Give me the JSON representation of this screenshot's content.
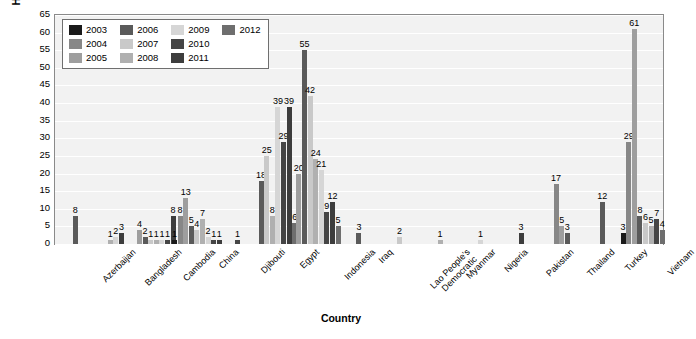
{
  "chart_data": {
    "type": "bar",
    "title": "",
    "xlabel": "Country",
    "ylabel": "Human H5N1 Cases",
    "ylim": [
      0,
      65
    ],
    "ytick_step": 5,
    "yticks": [
      65,
      60,
      55,
      50,
      45,
      40,
      35,
      30,
      25,
      20,
      15,
      10,
      5,
      0
    ],
    "grid": true,
    "legend_position": "top-left-inside",
    "categories": [
      "Azerbaijan",
      "Bangladesh",
      "Cambodia",
      "China",
      "Djibouti",
      "Egypt",
      "Indonesia",
      "Iraq",
      "Lao People's Democratic",
      "Myanmar",
      "Nigeria",
      "Pakistan",
      "Thailand",
      "Turkey",
      "Vietnam"
    ],
    "series": [
      {
        "name": "2003",
        "color": "#1a1a1a",
        "values": [
          0,
          0,
          0,
          1,
          0,
          0,
          0,
          0,
          0,
          0,
          0,
          0,
          0,
          0,
          3
        ]
      },
      {
        "name": "2004",
        "color": "#878787",
        "values": [
          0,
          0,
          0,
          8,
          0,
          0,
          0,
          0,
          0,
          0,
          0,
          0,
          17,
          0,
          29
        ]
      },
      {
        "name": "2005",
        "color": "#9e9e9e",
        "values": [
          0,
          0,
          4,
          13,
          0,
          0,
          20,
          0,
          0,
          0,
          0,
          0,
          5,
          0,
          61
        ]
      },
      {
        "name": "2006",
        "color": "#5a5a5a",
        "values": [
          8,
          0,
          2,
          5,
          0,
          18,
          55,
          3,
          0,
          0,
          0,
          0,
          3,
          12,
          8
        ]
      },
      {
        "name": "2007",
        "color": "#c9c9c9",
        "values": [
          0,
          0,
          1,
          4,
          0,
          25,
          42,
          0,
          2,
          0,
          0,
          0,
          0,
          0,
          6
        ]
      },
      {
        "name": "2008",
        "color": "#b0b0b0",
        "values": [
          0,
          1,
          1,
          7,
          0,
          8,
          24,
          0,
          0,
          1,
          0,
          0,
          0,
          0,
          5
        ]
      },
      {
        "name": "2009",
        "color": "#d6d6d6",
        "values": [
          0,
          2,
          1,
          2,
          0,
          39,
          21,
          0,
          0,
          0,
          1,
          0,
          0,
          0,
          0
        ]
      },
      {
        "name": "2010",
        "color": "#454545",
        "values": [
          0,
          0,
          1,
          1,
          1,
          29,
          9,
          0,
          0,
          0,
          0,
          0,
          0,
          0,
          7
        ]
      },
      {
        "name": "2011",
        "color": "#3d3d3d",
        "values": [
          0,
          3,
          8,
          1,
          0,
          39,
          12,
          0,
          0,
          0,
          0,
          3,
          0,
          0,
          0
        ]
      },
      {
        "name": "2012",
        "color": "#6e6e6e",
        "values": [
          0,
          0,
          0,
          0,
          0,
          6,
          5,
          0,
          0,
          0,
          0,
          0,
          0,
          0,
          4
        ]
      }
    ],
    "bar_labels": {
      "Azerbaijan": [
        8
      ],
      "Bangladesh": [
        1,
        2,
        3
      ],
      "Cambodia": [
        4,
        2,
        1,
        1,
        1,
        1,
        8
      ],
      "China": [
        1,
        8,
        13,
        5,
        4,
        7,
        2,
        1,
        1
      ],
      "Djibouti": [
        1
      ],
      "Egypt": [
        18,
        25,
        8,
        39,
        29,
        39,
        6
      ],
      "Indonesia": [
        20,
        55,
        42,
        24,
        21,
        9,
        12,
        5
      ],
      "Iraq": [
        3
      ],
      "Lao People's Democratic": [
        2
      ],
      "Myanmar": [
        1
      ],
      "Nigeria": [
        1
      ],
      "Pakistan": [
        3
      ],
      "Thailand": [
        17,
        5,
        3
      ],
      "Turkey": [
        12
      ],
      "Vietnam": [
        3,
        29,
        61,
        8,
        6,
        5,
        7,
        4
      ]
    }
  },
  "legend": {
    "items": [
      {
        "label": "2003",
        "color": "#1a1a1a"
      },
      {
        "label": "2006",
        "color": "#5a5a5a"
      },
      {
        "label": "2009",
        "color": "#d6d6d6"
      },
      {
        "label": "2012",
        "color": "#6e6e6e"
      },
      {
        "label": "2004",
        "color": "#878787"
      },
      {
        "label": "2007",
        "color": "#c9c9c9"
      },
      {
        "label": "2010",
        "color": "#454545"
      },
      {
        "label": "",
        "color": ""
      },
      {
        "label": "2005",
        "color": "#9e9e9e"
      },
      {
        "label": "2008",
        "color": "#b0b0b0"
      },
      {
        "label": "2011",
        "color": "#3d3d3d"
      },
      {
        "label": "",
        "color": ""
      }
    ]
  },
  "axis": {
    "y_title": "Human H5N1 Cases",
    "x_title": "Country"
  }
}
